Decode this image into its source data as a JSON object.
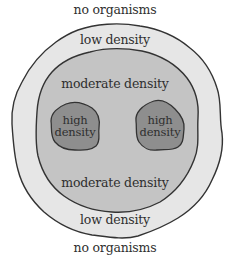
{
  "diagram": {
    "labels": {
      "top_outside": "no organisms",
      "bottom_outside": "no organisms",
      "low_top": "low density",
      "low_bottom": "low density",
      "moderate_top": "moderate density",
      "moderate_bottom": "moderate density",
      "high_left_line1": "high",
      "high_left_line2": "density",
      "high_right_line1": "high",
      "high_right_line2": "density"
    },
    "colors": {
      "background": "#ffffff",
      "low_density_fill": "#e6e6e6",
      "moderate_density_fill": "#c4c4c4",
      "high_density_fill": "#8e8e8e",
      "outline": "#333333",
      "text": "#2f2f2f"
    }
  }
}
